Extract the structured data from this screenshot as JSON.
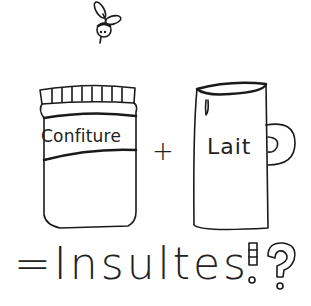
{
  "drawing": {
    "jar_label": "Confiture",
    "operator_plus": "+",
    "mug_label": "Lait",
    "result_text": "=Insultes",
    "punctuation": [
      "!",
      "?"
    ]
  },
  "icons": [
    "bee-icon",
    "jam-jar-icon",
    "milk-mug-icon",
    "exclamation-icon",
    "question-icon"
  ],
  "colors": {
    "ink": "#1a1a1a",
    "background": "#ffffff"
  }
}
